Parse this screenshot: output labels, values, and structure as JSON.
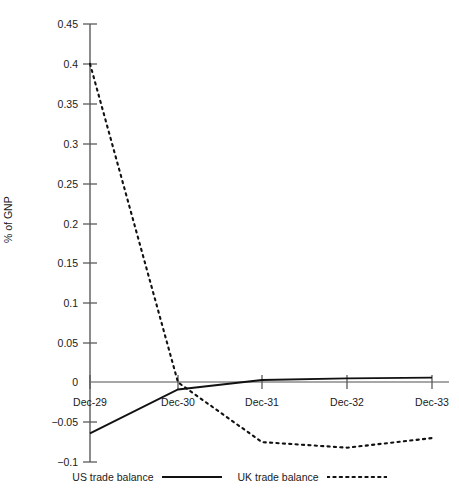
{
  "chart_data": {
    "type": "line",
    "title": "",
    "xlabel": "",
    "ylabel": "% of GNP",
    "categories": [
      "Dec-29",
      "Dec-30",
      "Dec-31",
      "Dec-32",
      "Dec-33"
    ],
    "series": [
      {
        "name": "US trade balance",
        "style": "solid",
        "color": "#000000",
        "values": [
          -0.064,
          -0.009,
          0.003,
          0.005,
          0.006
        ]
      },
      {
        "name": "UK trade balance",
        "style": "dotted",
        "color": "#000000",
        "values": [
          0.4,
          0.0,
          -0.075,
          -0.082,
          -0.07
        ]
      }
    ],
    "ylim": [
      -0.1,
      0.45
    ],
    "yticks": [
      -0.1,
      -0.05,
      0,
      0.05,
      0.1,
      0.15,
      0.2,
      0.25,
      0.3,
      0.35,
      0.4,
      0.45
    ],
    "ytick_labels": [
      "−0.1",
      "−0.05",
      "0",
      "0.05",
      "0.1",
      "0.15",
      "0.2",
      "0.25",
      "0.3",
      "0.35",
      "0.4",
      "0.45"
    ],
    "grid": false,
    "legend_position": "bottom",
    "zero_line": true
  },
  "axes": {
    "y_title": "% of GNP",
    "y_labels": {
      "t0": "0.45",
      "t1": "0.4",
      "t2": "0.35",
      "t3": "0.3",
      "t4": "0.25",
      "t5": "0.2",
      "t6": "0.15",
      "t7": "0.1",
      "t8": "0.05",
      "t9": "0",
      "t10": "−0.05",
      "t11": "−0.1"
    },
    "x_labels": {
      "c0": "Dec-29",
      "c1": "Dec-30",
      "c2": "Dec-31",
      "c3": "Dec-32",
      "c4": "Dec-33"
    }
  },
  "legend": {
    "items": [
      {
        "label": "US trade balance",
        "style": "solid"
      },
      {
        "label": "UK trade balance",
        "style": "dotted"
      }
    ]
  }
}
